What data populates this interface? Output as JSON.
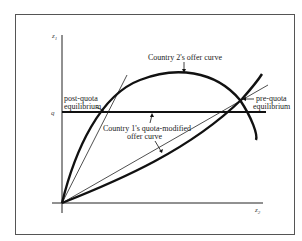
{
  "diagram": {
    "type": "offer-curve-diagram",
    "axes": {
      "y_label": "z",
      "y_subscript": "1",
      "x_label": "z",
      "x_subscript": "2",
      "q_tick_label": "q"
    },
    "labels": {
      "country2_curve": "Country 2's offer curve",
      "country1_curve_line1": "Country 1's quota-modified",
      "country1_curve_line2": "offer curve",
      "post_quota_line1": "post-quota",
      "post_quota_line2": "equilibrium",
      "pre_quota_line1": "pre-quota",
      "pre_quota_line2": "equilibrium"
    },
    "colors": {
      "ink": "#111111",
      "frame": "#555555",
      "background": "#ffffff"
    }
  }
}
